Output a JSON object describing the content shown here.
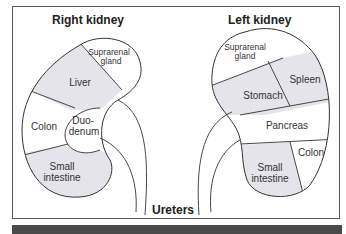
{
  "titles": {
    "right_kidney": "Right kidney",
    "left_kidney": "Left kidney",
    "ureters": "Ureters"
  },
  "right_kidney": {
    "regions": [
      {
        "name": "suprarenal-gland",
        "line1": "Suprarenal",
        "line2": "gland",
        "shaded": false
      },
      {
        "name": "liver",
        "line1": "Liver",
        "shaded": true
      },
      {
        "name": "colon",
        "line1": "Colon",
        "shaded": false
      },
      {
        "name": "duodenum",
        "line1": "Duo-",
        "line2": "denum",
        "shaded": false
      },
      {
        "name": "small-intestine",
        "line1": "Small",
        "line2": "intestine",
        "shaded": true
      }
    ]
  },
  "left_kidney": {
    "regions": [
      {
        "name": "suprarenal-gland",
        "line1": "Suprarenal",
        "line2": "gland",
        "shaded": false
      },
      {
        "name": "spleen",
        "line1": "Spleen",
        "shaded": true
      },
      {
        "name": "stomach",
        "line1": "Stomach",
        "shaded": true
      },
      {
        "name": "pancreas",
        "line1": "Pancreas",
        "shaded": false
      },
      {
        "name": "colon",
        "line1": "Colon",
        "shaded": false
      },
      {
        "name": "small-intestine",
        "line1": "Small",
        "line2": "intestine",
        "shaded": true
      }
    ]
  },
  "colors": {
    "shaded": "#e4e4ea",
    "stroke": "#333333",
    "frame": "#5a5a5a",
    "band": "#4a4a4a"
  }
}
